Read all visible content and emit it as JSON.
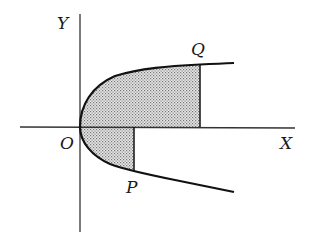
{
  "diagram": {
    "type": "parabola-area",
    "labels": {
      "y_axis": "Y",
      "x_axis": "X",
      "origin": "O",
      "point_upper": "Q",
      "point_lower": "P"
    },
    "colors": {
      "line": "#1a1a1a",
      "shade": "#bdbdbd",
      "background": "#ffffff"
    }
  }
}
